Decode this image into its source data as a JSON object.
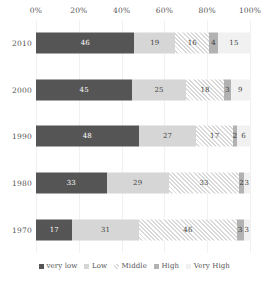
{
  "chart_data": {
    "type": "bar",
    "subtype": "stacked-horizontal-100-percent",
    "title": "",
    "subtitle": "",
    "xlabel": "",
    "ylabel": "",
    "xlim": [
      0,
      100
    ],
    "grid": true,
    "legend_position": "bottom",
    "orientation": "horizontal",
    "stacked": true,
    "categories": [
      "2010",
      "2000",
      "1990",
      "1980",
      "1970"
    ],
    "x_tick_labels": [
      "0%",
      "20%",
      "40%",
      "60%",
      "80%",
      "100%"
    ],
    "x_tick_values": [
      0,
      20,
      40,
      60,
      80,
      100
    ],
    "series": [
      {
        "name": "very low",
        "color": "#555555",
        "pattern": "solid",
        "values": [
          46,
          45,
          48,
          33,
          17
        ]
      },
      {
        "name": "Low",
        "color": "#d6d6d6",
        "pattern": "solid",
        "values": [
          19,
          25,
          27,
          29,
          31
        ]
      },
      {
        "name": "Middle",
        "color": "#ffffff",
        "pattern": "diagonal-hatch",
        "values": [
          16,
          18,
          17,
          33,
          46
        ]
      },
      {
        "name": "High",
        "color": "#b2b2b2",
        "pattern": "solid",
        "values": [
          4,
          3,
          2,
          2,
          3
        ]
      },
      {
        "name": "Very High",
        "color": "#f1f1f1",
        "pattern": "solid",
        "values": [
          15,
          9,
          6,
          3,
          3
        ]
      }
    ]
  },
  "axis": {
    "ticks": [
      {
        "label": "0%",
        "value": 0
      },
      {
        "label": "20%",
        "value": 20
      },
      {
        "label": "40%",
        "value": 40
      },
      {
        "label": "60%",
        "value": 60
      },
      {
        "label": "80%",
        "value": 80
      },
      {
        "label": "100%",
        "value": 100
      }
    ]
  },
  "rows": [
    {
      "label": "2010",
      "segments": [
        {
          "series": "very low",
          "value": 46,
          "label": "46"
        },
        {
          "series": "Low",
          "value": 19,
          "label": "19"
        },
        {
          "series": "Middle",
          "value": 16,
          "label": "16"
        },
        {
          "series": "High",
          "value": 4,
          "label": "4"
        },
        {
          "series": "Very High",
          "value": 15,
          "label": "15"
        }
      ]
    },
    {
      "label": "2000",
      "segments": [
        {
          "series": "very low",
          "value": 45,
          "label": "45"
        },
        {
          "series": "Low",
          "value": 25,
          "label": "25"
        },
        {
          "series": "Middle",
          "value": 18,
          "label": "18"
        },
        {
          "series": "High",
          "value": 3,
          "label": "3"
        },
        {
          "series": "Very High",
          "value": 9,
          "label": "9"
        }
      ]
    },
    {
      "label": "1990",
      "segments": [
        {
          "series": "very low",
          "value": 48,
          "label": "48"
        },
        {
          "series": "Low",
          "value": 27,
          "label": "27"
        },
        {
          "series": "Middle",
          "value": 17,
          "label": "17"
        },
        {
          "series": "High",
          "value": 2,
          "label": "2"
        },
        {
          "series": "Very High",
          "value": 6,
          "label": "6"
        }
      ]
    },
    {
      "label": "1980",
      "segments": [
        {
          "series": "very low",
          "value": 33,
          "label": "33"
        },
        {
          "series": "Low",
          "value": 29,
          "label": "29"
        },
        {
          "series": "Middle",
          "value": 33,
          "label": "33"
        },
        {
          "series": "High",
          "value": 2,
          "label": "2"
        },
        {
          "series": "Very High",
          "value": 3,
          "label": "3"
        }
      ]
    },
    {
      "label": "1970",
      "segments": [
        {
          "series": "very low",
          "value": 17,
          "label": "17"
        },
        {
          "series": "Low",
          "value": 31,
          "label": "31"
        },
        {
          "series": "Middle",
          "value": 46,
          "label": "46"
        },
        {
          "series": "High",
          "value": 3,
          "label": "3"
        },
        {
          "series": "Very High",
          "value": 3,
          "label": "3"
        }
      ]
    }
  ],
  "legend": {
    "items": [
      {
        "label": "very low",
        "color": "#555555",
        "pattern": "solid"
      },
      {
        "label": "Low",
        "color": "#d6d6d6",
        "pattern": "solid"
      },
      {
        "label": "Middle",
        "color": "#ffffff",
        "pattern": "diagonal-hatch"
      },
      {
        "label": "High",
        "color": "#b2b2b2",
        "pattern": "solid"
      },
      {
        "label": "Very High",
        "color": "#f1f1f1",
        "pattern": "solid"
      }
    ]
  }
}
